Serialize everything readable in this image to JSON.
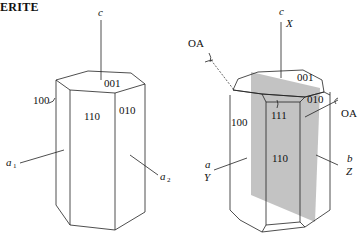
{
  "title": "ERITE",
  "figures": [
    {
      "name": "left-crystal",
      "axes": {
        "c": "c",
        "a1": "a",
        "a1_sub": "1",
        "a2": "a",
        "a2_sub": "2"
      },
      "faces": {
        "top": "001",
        "front": "110",
        "right": "010",
        "left": "100"
      }
    },
    {
      "name": "right-crystal",
      "axes": {
        "c": "c",
        "x": "X",
        "a": "a",
        "y": "Y",
        "b": "b",
        "z": "Z"
      },
      "optic_axes": {
        "left": "OA",
        "right": "OA"
      },
      "faces": {
        "top": "001",
        "pyramid": "111",
        "right": "010",
        "left": "100",
        "front": "110"
      },
      "optic_plane_color": "#b8b8b8"
    }
  ]
}
